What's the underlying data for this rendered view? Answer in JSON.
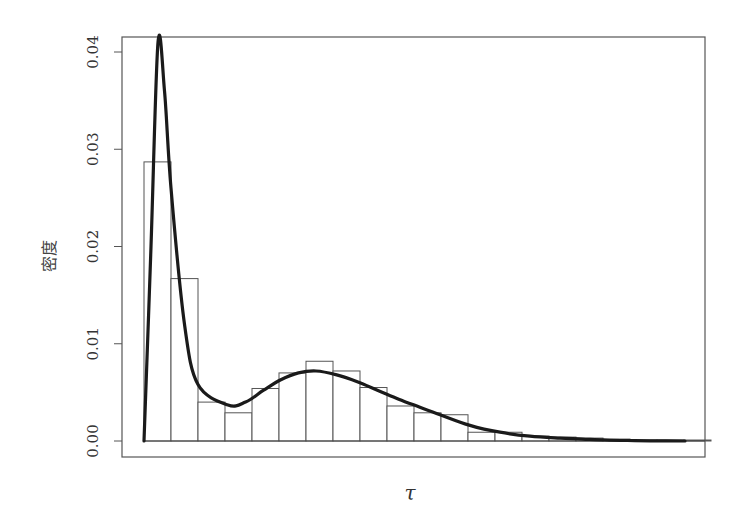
{
  "chart_data": {
    "type": "bar",
    "subtype": "histogram_with_density_curve",
    "title": "",
    "xlabel": "τ",
    "ylabel": "密度",
    "ylim": [
      0,
      0.041
    ],
    "yticks": [
      0.0,
      0.01,
      0.02,
      0.03,
      0.04
    ],
    "ytick_labels": [
      "0.00",
      "0.01",
      "0.02",
      "0.03",
      "0.04"
    ],
    "xticks_shown": false,
    "grid": false,
    "legend": null,
    "bins": {
      "count": 21,
      "values": [
        0.0287,
        0.0167,
        0.004,
        0.0029,
        0.0054,
        0.007,
        0.0082,
        0.0072,
        0.0055,
        0.0036,
        0.0029,
        0.0027,
        0.0009,
        0.0009,
        0.0005,
        0.0004,
        0.0003,
        0.0002,
        0.0001,
        0.0001,
        0.0001
      ]
    },
    "series": [
      {
        "name": "density curve",
        "type": "line",
        "description": "Bimodal density: sharp peak ~0.041 near first bin, local minimum ~0.0035, second mode ~0.0072, long right tail",
        "points": [
          [
            0.0,
            0.0
          ],
          [
            0.25,
            0.02
          ],
          [
            0.5,
            0.041
          ],
          [
            0.75,
            0.036
          ],
          [
            1.0,
            0.026
          ],
          [
            1.5,
            0.012
          ],
          [
            2.0,
            0.0058
          ],
          [
            2.5,
            0.0037
          ],
          [
            3.0,
            0.004
          ],
          [
            3.5,
            0.0052
          ],
          [
            4.0,
            0.0063
          ],
          [
            4.5,
            0.007
          ],
          [
            5.0,
            0.0072
          ],
          [
            5.5,
            0.0068
          ],
          [
            6.0,
            0.0061
          ],
          [
            6.5,
            0.0052
          ],
          [
            7.0,
            0.0043
          ],
          [
            7.5,
            0.0035
          ],
          [
            8.0,
            0.0027
          ],
          [
            9.0,
            0.0016
          ],
          [
            10.0,
            0.0009
          ],
          [
            11.0,
            0.0005
          ],
          [
            12.0,
            0.0003
          ],
          [
            13.0,
            0.0002
          ],
          [
            14.0,
            0.0001
          ],
          [
            15.0,
            5e-05
          ],
          [
            16.0,
            2e-05
          ],
          [
            20.0,
            0.0
          ]
        ]
      }
    ]
  },
  "axes": {
    "y_label": "密度",
    "x_label": "τ"
  }
}
